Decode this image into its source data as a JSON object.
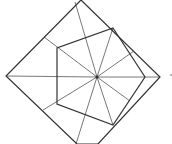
{
  "diagram": {
    "stroke_color": "#333333",
    "thin_color": "#555555",
    "square": [
      [
        81,
        0
      ],
      [
        160,
        77
      ],
      [
        98,
        144
      ],
      [
        77,
        144
      ],
      [
        6,
        76
      ]
    ],
    "pentagon": [
      [
        113,
        28
      ],
      [
        145,
        77
      ],
      [
        113,
        125
      ],
      [
        57,
        104
      ],
      [
        57,
        48
      ]
    ],
    "center": [
      97,
      77
    ],
    "rays": [
      [
        [
          97,
          77
        ],
        [
          6,
          76
        ]
      ],
      [
        [
          97,
          77
        ],
        [
          160,
          77
        ]
      ],
      [
        [
          97,
          77
        ],
        [
          75,
          2
        ]
      ],
      [
        [
          97,
          77
        ],
        [
          76,
          144
        ]
      ],
      [
        [
          97,
          77
        ],
        [
          44,
          37
        ]
      ],
      [
        [
          97,
          77
        ],
        [
          43,
          110
        ]
      ],
      [
        [
          97,
          77
        ],
        [
          113,
          28
        ]
      ],
      [
        [
          97,
          77
        ],
        [
          113,
          125
        ]
      ],
      [
        [
          97,
          77
        ],
        [
          134,
          51
        ]
      ],
      [
        [
          97,
          77
        ],
        [
          130,
          101
        ]
      ]
    ],
    "marker_dot": [
      171,
      75
    ]
  }
}
